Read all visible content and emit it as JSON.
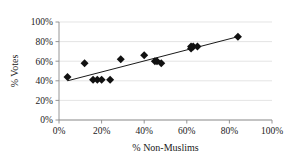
{
  "chart_data": {
    "type": "scatter",
    "title": "",
    "xlabel": "% Non-Muslims",
    "ylabel": "% Votes",
    "xlim": [
      0,
      100
    ],
    "ylim": [
      0,
      100
    ],
    "xticks": [
      "0%",
      "20%",
      "40%",
      "60%",
      "80%",
      "100%"
    ],
    "xtick_values": [
      0,
      20,
      40,
      60,
      80,
      100
    ],
    "yticks": [
      "0%",
      "20%",
      "40%",
      "60%",
      "80%",
      "100%"
    ],
    "ytick_values": [
      0,
      20,
      40,
      60,
      80,
      100
    ],
    "grid": "horizontal",
    "legend": "none",
    "marker": "diamond",
    "marker_color": "#111111",
    "points": [
      {
        "x": 4,
        "y": 44
      },
      {
        "x": 12,
        "y": 58
      },
      {
        "x": 16,
        "y": 41
      },
      {
        "x": 18,
        "y": 41
      },
      {
        "x": 20,
        "y": 41
      },
      {
        "x": 24,
        "y": 41
      },
      {
        "x": 29,
        "y": 62
      },
      {
        "x": 40,
        "y": 66
      },
      {
        "x": 45,
        "y": 60
      },
      {
        "x": 46,
        "y": 60
      },
      {
        "x": 48,
        "y": 58
      },
      {
        "x": 62,
        "y": 73
      },
      {
        "x": 62,
        "y": 75
      },
      {
        "x": 63,
        "y": 75
      },
      {
        "x": 65,
        "y": 75
      },
      {
        "x": 84,
        "y": 85
      }
    ],
    "trendline": {
      "type": "linear",
      "x_start": 4,
      "y_start": 40,
      "x_end": 84,
      "y_end": 85
    }
  }
}
